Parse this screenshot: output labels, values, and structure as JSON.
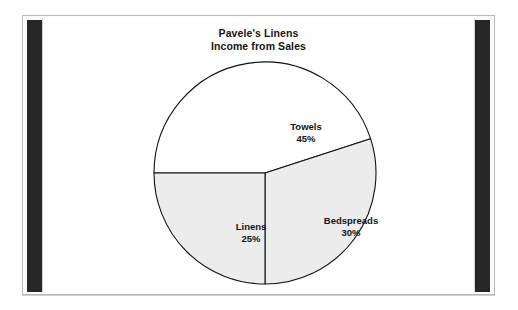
{
  "figure": {
    "title_line1": "Pavele's Linens",
    "title_line2": "Income from Sales"
  },
  "colors": {
    "page_background": "#ffffff",
    "panel_background": "#fbfbfb",
    "panel_border": "#b9b9b9",
    "side_bar": "#272727",
    "stage_background": "#ffffff",
    "slice_outline": "#111111",
    "slice_white": "#ffffff",
    "slice_gray": "#ececec",
    "text": "#141414"
  },
  "chart_data": {
    "type": "pie",
    "title": "Pavele's Linens Income from Sales",
    "categories": [
      "Towels",
      "Bedspreads",
      "Linens"
    ],
    "values": [
      45,
      30,
      25
    ],
    "value_labels": [
      "45%",
      "30%",
      "25%"
    ],
    "unit": "percent",
    "total": 100,
    "legend": "none",
    "labels_inside_slices": true,
    "slices": [
      {
        "name": "Towels",
        "label": "Towels",
        "value": 45,
        "value_label": "45%",
        "fill": "#ffffff",
        "start_angle_deg": 180,
        "end_angle_deg": 342
      },
      {
        "name": "Bedspreads",
        "label": "Bedspreads",
        "value": 30,
        "value_label": "30%",
        "fill": "#ececec",
        "start_angle_deg": 342,
        "end_angle_deg": 450
      },
      {
        "name": "Linens",
        "label": "Linens",
        "value": 25,
        "value_label": "25%",
        "fill": "#ececec",
        "start_angle_deg": 90,
        "end_angle_deg": 180
      }
    ]
  }
}
